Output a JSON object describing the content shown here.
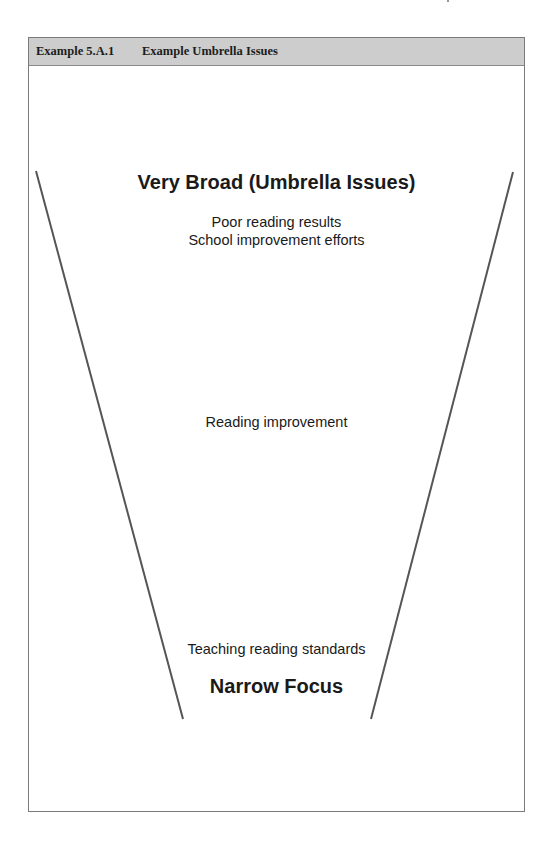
{
  "header": {
    "example_number": "Example 5.A.1",
    "example_title": "Example Umbrella Issues"
  },
  "funnel": {
    "top_label": "Very Broad (Umbrella Issues)",
    "broad_items": [
      "Poor reading results",
      "School improvement efforts"
    ],
    "middle_item": "Reading improvement",
    "narrow_item": "Teaching reading standards",
    "bottom_label": "Narrow Focus",
    "line_color": "#555555"
  }
}
